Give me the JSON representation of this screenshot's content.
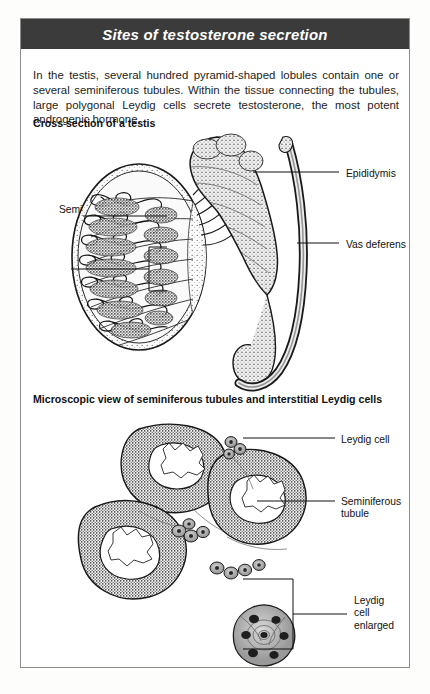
{
  "page": {
    "title": "Sites of testosterone secretion",
    "intro": "In the testis, several hundred pyramid-shaped lobules contain one or several seminiferous tubules. Within the tissue connecting the tubules, large polygonal Leydig cells secrete testosterone, the most potent androgenic hormone.",
    "title_bar_color": "#3b3b3b",
    "title_text_color": "#ffffff",
    "border_color": "#8d8d8d",
    "background_color": "#ffffff"
  },
  "sections": [
    {
      "heading": "Cross section of a testis",
      "labels": {
        "epididymis": "Epididymis",
        "vas_deferens": "Vas deferens",
        "seminiferous_tubules_line1": "Seminiferous",
        "seminiferous_tubules_line2": "tubules",
        "lobule": "Lobule"
      }
    },
    {
      "heading": "Microscopic view of seminiferous  tubules and interstitial Leydig cells",
      "labels": {
        "leydig_cell": "Leydig cell",
        "seminiferous_tubule_line1": "Seminiferous",
        "seminiferous_tubule_line2": "tubule",
        "leydig_enlarged_line1": "Leydig",
        "leydig_enlarged_line2": "cell",
        "leydig_enlarged_line3": "enlarged"
      }
    }
  ]
}
